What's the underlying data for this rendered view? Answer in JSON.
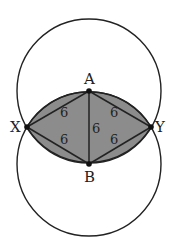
{
  "diagram": {
    "points": {
      "A": {
        "label": "A",
        "x": 89,
        "y": 91
      },
      "B": {
        "label": "B",
        "x": 89,
        "y": 164
      },
      "X": {
        "label": "X",
        "x": 27,
        "y": 127
      },
      "Y": {
        "label": "Y",
        "x": 151,
        "y": 127
      }
    },
    "segments": [
      {
        "from": "X",
        "to": "A",
        "length_label": "6"
      },
      {
        "from": "A",
        "to": "Y",
        "length_label": "6"
      },
      {
        "from": "A",
        "to": "B",
        "length_label": "6"
      },
      {
        "from": "X",
        "to": "B",
        "length_label": "6"
      },
      {
        "from": "B",
        "to": "Y",
        "length_label": "6"
      }
    ],
    "circles": [
      {
        "center": "A",
        "radius_px": 72
      },
      {
        "center": "B",
        "radius_px": 72
      }
    ],
    "shaded_region": "lens (intersection of the two circles)",
    "colors": {
      "shade": "#8c8c8c",
      "stroke": "#222222",
      "background": "#ffffff"
    }
  }
}
